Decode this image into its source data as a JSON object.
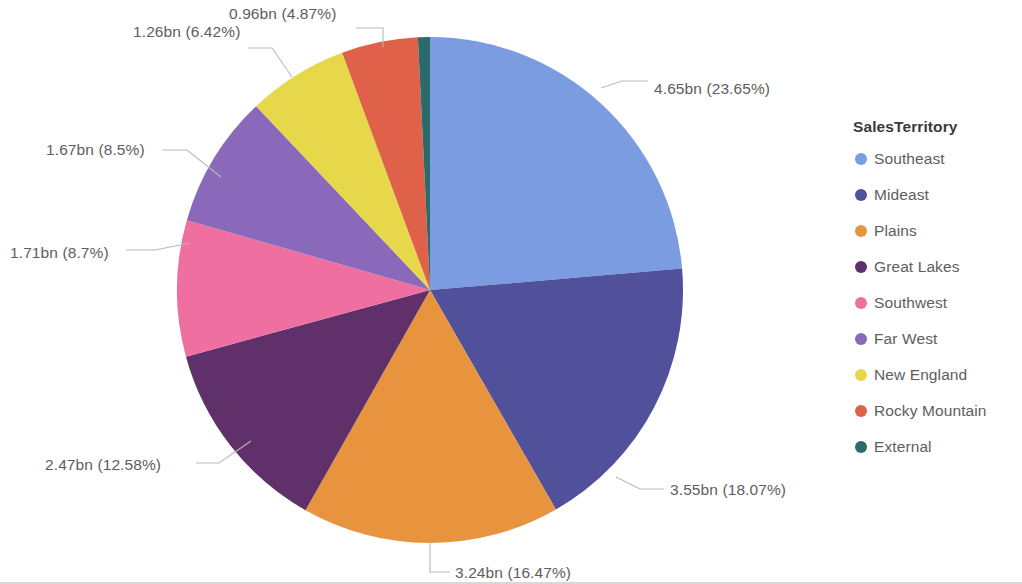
{
  "chart_data": {
    "type": "pie",
    "title": "",
    "legend_title": "SalesTerritory",
    "legend_position": "right",
    "value_unit": "bn",
    "total": 19.66,
    "start_angle_deg": 0,
    "direction": "clockwise",
    "categories": [
      "Southeast",
      "Mideast",
      "Plains",
      "Great Lakes",
      "Southwest",
      "Far West",
      "New England",
      "Rocky Mountain",
      "External"
    ],
    "values": [
      4.65,
      3.55,
      3.24,
      2.47,
      1.71,
      1.67,
      1.26,
      0.96,
      0.15
    ],
    "percentages": [
      23.65,
      18.07,
      16.47,
      12.58,
      8.7,
      8.5,
      6.42,
      4.87,
      0.74
    ],
    "colors": [
      "#7b9ce0",
      "#51509b",
      "#e8943f",
      "#5f3069",
      "#ef6fa1",
      "#8a69ba",
      "#e7d74a",
      "#e0614a",
      "#2c6b6b"
    ],
    "slice_labels": [
      "4.65bn (23.65%)",
      "3.55bn (18.07%)",
      "3.24bn (16.47%)",
      "2.47bn (12.58%)",
      "1.71bn (8.7%)",
      "1.67bn (8.5%)",
      "1.26bn (6.42%)",
      "0.96bn (4.87%)",
      ""
    ],
    "labels_shown": [
      true,
      true,
      true,
      true,
      true,
      true,
      true,
      true,
      false
    ]
  },
  "callouts": [
    {
      "text": "4.65bn (23.65%)",
      "x": 654,
      "y": 94,
      "anchor": "start",
      "line": [
        [
          601,
          88
        ],
        [
          622,
          81
        ],
        [
          648,
          81
        ]
      ]
    },
    {
      "text": "3.55bn (18.07%)",
      "x": 670,
      "y": 495,
      "anchor": "start",
      "line": [
        [
          616,
          477
        ],
        [
          640,
          489
        ],
        [
          664,
          489
        ]
      ]
    },
    {
      "text": "3.24bn (16.47%)",
      "x": 455,
      "y": 578,
      "anchor": "start",
      "line": [
        [
          430,
          542
        ],
        [
          430,
          572
        ],
        [
          450,
          572
        ]
      ]
    },
    {
      "text": "2.47bn (12.58%)",
      "x": 45,
      "y": 470,
      "anchor": "start",
      "line": [
        [
          251,
          441
        ],
        [
          219,
          463
        ],
        [
          196,
          463
        ]
      ]
    },
    {
      "text": "1.71bn (8.7%)",
      "x": 10,
      "y": 258,
      "anchor": "start",
      "line": [
        [
          190,
          243
        ],
        [
          155,
          250
        ],
        [
          126,
          250
        ]
      ]
    },
    {
      "text": "1.67bn (8.5%)",
      "x": 46,
      "y": 155,
      "anchor": "start",
      "line": [
        [
          221,
          177
        ],
        [
          187,
          150
        ],
        [
          162,
          150
        ]
      ]
    },
    {
      "text": "1.26bn (6.42%)",
      "x": 133,
      "y": 37,
      "anchor": "start",
      "line": [
        [
          292,
          77
        ],
        [
          272,
          48
        ],
        [
          248,
          48
        ]
      ]
    },
    {
      "text": "0.96bn (4.87%)",
      "x": 229,
      "y": 19,
      "anchor": "start",
      "line": [
        [
          383,
          47
        ],
        [
          383,
          28
        ],
        [
          356,
          28
        ]
      ]
    }
  ],
  "legend": {
    "title": "SalesTerritory",
    "title_x": 853,
    "title_y": 132,
    "start_y": 164,
    "row_height": 36,
    "swatch_x": 861,
    "swatch_r": 6,
    "text_x": 874,
    "items": [
      {
        "label": "Southeast",
        "color": "#7b9ce0"
      },
      {
        "label": "Mideast",
        "color": "#51509b"
      },
      {
        "label": "Plains",
        "color": "#e8943f"
      },
      {
        "label": "Great Lakes",
        "color": "#5f3069"
      },
      {
        "label": "Southwest",
        "color": "#ef6fa1"
      },
      {
        "label": "Far West",
        "color": "#8a69ba"
      },
      {
        "label": "New England",
        "color": "#e7d74a"
      },
      {
        "label": "Rocky Mountain",
        "color": "#e0614a"
      },
      {
        "label": "External",
        "color": "#2c6b6b"
      }
    ]
  },
  "geometry": {
    "center_x": 430,
    "center_y": 290,
    "radius": 253
  }
}
